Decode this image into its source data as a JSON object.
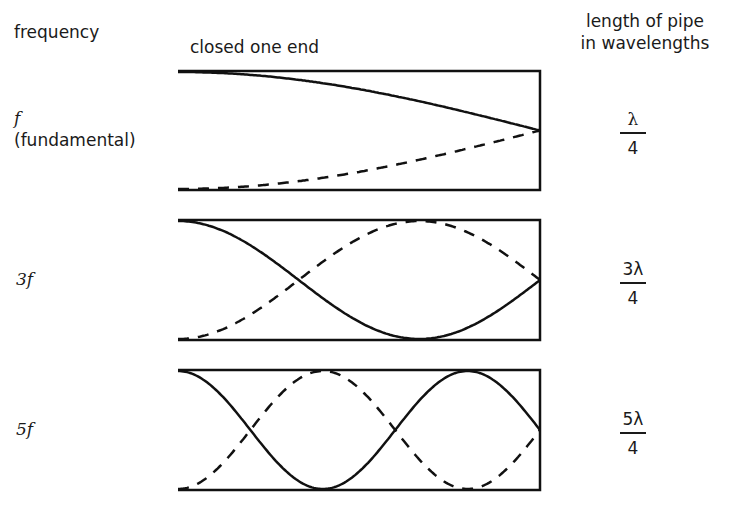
{
  "headers": {
    "frequency": "frequency",
    "pipe_type": "closed one end",
    "length_line1": "length of pipe",
    "length_line2": "in wavelengths"
  },
  "harmonics": [
    {
      "frequency_label": "f",
      "frequency_note": "(fundamental)",
      "length_numerator": "λ",
      "length_denominator": "4",
      "quarter_wavelengths": 1
    },
    {
      "frequency_label": "3f",
      "frequency_note": "",
      "length_numerator": "3λ",
      "length_denominator": "4",
      "quarter_wavelengths": 3
    },
    {
      "frequency_label": "5f",
      "frequency_note": "",
      "length_numerator": "5λ",
      "length_denominator": "4",
      "quarter_wavelengths": 5
    }
  ],
  "style": {
    "line_color": "#111111",
    "text_color": "#1a1a1a",
    "background": "#ffffff"
  }
}
